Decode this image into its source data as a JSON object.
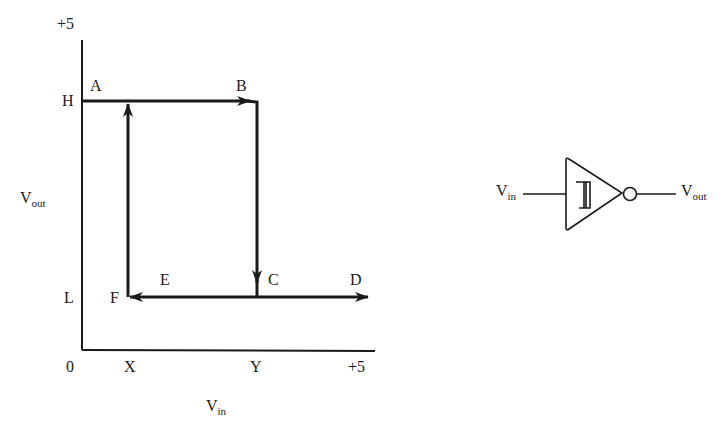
{
  "graph": {
    "y_axis": {
      "label_main": "V",
      "label_sub": "out",
      "top_tick": "+5",
      "high": "H",
      "low": "L",
      "origin": "0"
    },
    "x_axis": {
      "label_main": "V",
      "label_sub": "in",
      "ticks": [
        "X",
        "Y",
        "+5"
      ]
    },
    "points": {
      "A": "A",
      "B": "B",
      "C": "C",
      "D": "D",
      "E": "E",
      "F": "F"
    }
  },
  "gate": {
    "input_main": "V",
    "input_sub": "in",
    "output_main": "V",
    "output_sub": "out",
    "symbol": "schmitt-trigger-inverter"
  },
  "colors": {
    "ink": "#1a1a1a",
    "background": "#ffffff"
  }
}
